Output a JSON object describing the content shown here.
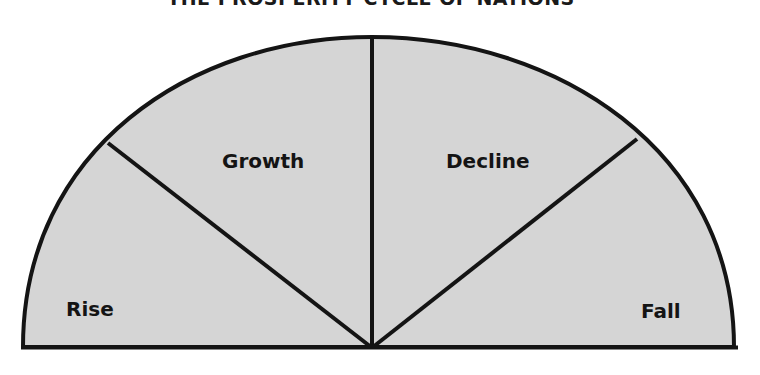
{
  "title": "THE PROSPERITY CYCLE OF NATIONS",
  "diagram": {
    "type": "semicircle-phase-diagram",
    "fill_color": "#d5d5d5",
    "stroke_color": "#141414",
    "segments": [
      {
        "id": "rise",
        "label": "Rise"
      },
      {
        "id": "growth",
        "label": "Growth"
      },
      {
        "id": "decline",
        "label": "Decline"
      },
      {
        "id": "fall",
        "label": "Fall"
      }
    ]
  }
}
